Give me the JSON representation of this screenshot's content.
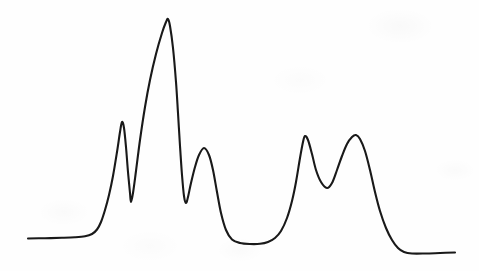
{
  "figure": {
    "kind": "spectrum-trace",
    "title": "",
    "caption": "",
    "background_color": "#fefefe",
    "stroke_color": "#191919",
    "stroke_width": 2.1,
    "width": 479,
    "height": 271,
    "has_axes": false,
    "has_labels": false,
    "has_gridlines": false,
    "has_legend": false
  },
  "chart_data": {
    "type": "line",
    "title": "",
    "subtitle": "",
    "xlabel": "",
    "ylabel": "",
    "xlim": [
      0,
      479
    ],
    "ylim": [
      271,
      0
    ],
    "grid": false,
    "legend": "none",
    "axes_visible": false,
    "tick_labels_x": [],
    "tick_labels_y": [],
    "annotations": [],
    "series": [
      {
        "name": "trace",
        "color": "#191919",
        "points": [
          [
            28,
            238.5
          ],
          [
            45,
            238.2
          ],
          [
            62,
            237.8
          ],
          [
            75,
            237.3
          ],
          [
            85,
            236.3
          ],
          [
            92,
            234.0
          ],
          [
            97,
            229.5
          ],
          [
            101,
            222.0
          ],
          [
            105,
            210.0
          ],
          [
            109,
            195.0
          ],
          [
            113,
            176.0
          ],
          [
            117,
            152.0
          ],
          [
            120,
            132.0
          ],
          [
            122,
            122.0
          ],
          [
            124,
            128.0
          ],
          [
            126,
            147.0
          ],
          [
            128,
            172.0
          ],
          [
            130,
            193.0
          ],
          [
            131,
            202.0
          ],
          [
            133,
            193.0
          ],
          [
            136,
            171.0
          ],
          [
            140,
            140.0
          ],
          [
            145,
            107.0
          ],
          [
            150,
            80.0
          ],
          [
            156,
            54.0
          ],
          [
            162,
            33.0
          ],
          [
            166,
            22.0
          ],
          [
            168,
            19.0
          ],
          [
            170,
            26.0
          ],
          [
            173,
            48.0
          ],
          [
            176,
            82.0
          ],
          [
            178,
            113.0
          ],
          [
            180,
            146.0
          ],
          [
            182,
            175.0
          ],
          [
            184,
            196.0
          ],
          [
            186,
            203.0
          ],
          [
            188,
            197.0
          ],
          [
            191,
            183.0
          ],
          [
            195,
            167.0
          ],
          [
            199,
            155.0
          ],
          [
            204,
            148.0
          ],
          [
            209,
            155.0
          ],
          [
            213,
            170.0
          ],
          [
            217,
            192.0
          ],
          [
            221,
            213.0
          ],
          [
            226,
            230.0
          ],
          [
            232,
            239.5
          ],
          [
            240,
            243.0
          ],
          [
            250,
            244.0
          ],
          [
            260,
            243.8
          ],
          [
            268,
            242.0
          ],
          [
            275,
            238.0
          ],
          [
            281,
            231.0
          ],
          [
            287,
            218.0
          ],
          [
            292,
            201.0
          ],
          [
            296,
            182.0
          ],
          [
            300,
            158.0
          ],
          [
            303,
            142.0
          ],
          [
            305,
            136.0
          ],
          [
            308,
            140.0
          ],
          [
            312,
            154.0
          ],
          [
            316,
            170.0
          ],
          [
            321,
            182.0
          ],
          [
            327,
            188.0
          ],
          [
            332,
            183.0
          ],
          [
            337,
            170.0
          ],
          [
            342,
            156.0
          ],
          [
            347,
            144.0
          ],
          [
            352,
            137.0
          ],
          [
            356,
            135.0
          ],
          [
            360,
            139.0
          ],
          [
            365,
            151.0
          ],
          [
            370,
            170.0
          ],
          [
            375,
            192.0
          ],
          [
            380,
            211.0
          ],
          [
            386,
            228.0
          ],
          [
            392,
            240.0
          ],
          [
            398,
            248.0
          ],
          [
            404,
            252.0
          ],
          [
            412,
            253.5
          ],
          [
            425,
            253.5
          ],
          [
            440,
            253.0
          ],
          [
            455,
            252.5
          ]
        ]
      }
    ],
    "peaks": [
      {
        "index": 1,
        "x": 122,
        "y_top": 122,
        "height": 116.5,
        "label": ""
      },
      {
        "index": 2,
        "x": 168,
        "y_top": 19,
        "height": 219.5,
        "label": ""
      },
      {
        "index": 3,
        "x": 204,
        "y_top": 148,
        "height": 90.5,
        "label": ""
      },
      {
        "index": 4,
        "x": 305,
        "y_top": 136,
        "height": 102.5,
        "label": ""
      },
      {
        "index": 5,
        "x": 356,
        "y_top": 135,
        "height": 103.5,
        "label": ""
      }
    ],
    "valleys": [
      {
        "between": [
          1,
          2
        ],
        "x": 131,
        "y": 202
      },
      {
        "between": [
          2,
          3
        ],
        "x": 186,
        "y": 203
      },
      {
        "between": [
          3,
          4
        ],
        "x": 250,
        "y": 244
      },
      {
        "between": [
          4,
          5
        ],
        "x": 327,
        "y": 188
      }
    ],
    "baseline": {
      "left_y": 238.5,
      "right_y": 253.5,
      "left_start_x": 28,
      "right_end_x": 455
    }
  }
}
